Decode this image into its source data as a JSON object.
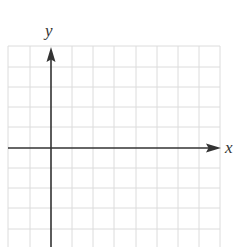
{
  "diagram": {
    "type": "coordinate-grid",
    "axis_labels": {
      "x": "x",
      "y": "y"
    },
    "colors": {
      "grid": "#dcdcdc",
      "axis": "#333333",
      "label": "#333333",
      "background": "#ffffff"
    },
    "grid": {
      "columns_left_of_y_axis": 2,
      "columns_right_of_y_axis": 8,
      "rows_above_x_axis": 5,
      "rows_below_x_axis": 5
    }
  }
}
